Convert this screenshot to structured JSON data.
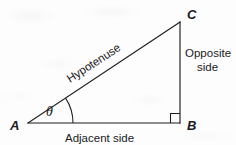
{
  "figure": {
    "background_color": "#fdfdfd",
    "stroke_color": "#1d1d1d",
    "text_color": "#1a1a1a"
  },
  "vertices": {
    "a": {
      "label": "A",
      "x": 28,
      "y": 123
    },
    "b": {
      "label": "B",
      "x": 180,
      "y": 123
    },
    "c": {
      "label": "C",
      "x": 180,
      "y": 22
    }
  },
  "angle": {
    "symbol": "θ",
    "at_vertex": "A",
    "arc_radius": 45,
    "marker": "right-angle-square",
    "right_angle_at": "B"
  },
  "sides": {
    "hypotenuse": {
      "label": "Hypotenuse",
      "from": "A",
      "to": "C",
      "rotation_deg": -33
    },
    "adjacent": {
      "label": "Adjacent side",
      "from": "A",
      "to": "B"
    },
    "opposite": {
      "label_line1": "Opposite",
      "label_line2": "side",
      "from": "B",
      "to": "C"
    }
  }
}
